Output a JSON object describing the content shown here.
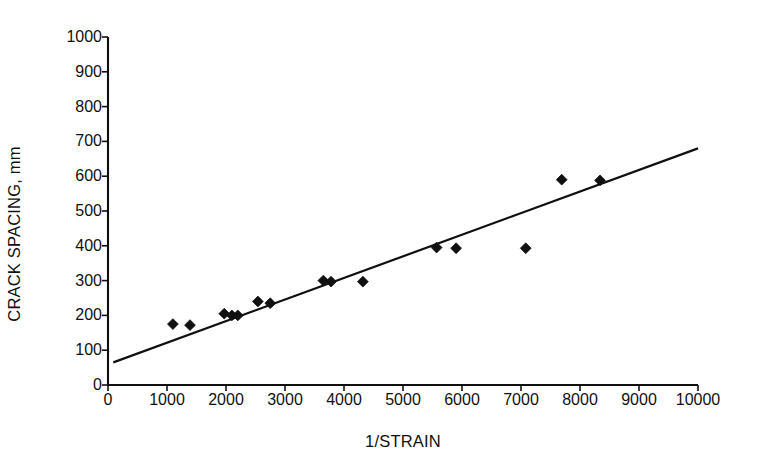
{
  "chart_data": {
    "type": "scatter",
    "title": "",
    "xlabel": "1/STRAIN",
    "ylabel": "CRACK SPACING, mm",
    "xlim": [
      0,
      10000
    ],
    "ylim": [
      0,
      1000
    ],
    "xticks": [
      0,
      1000,
      2000,
      3000,
      4000,
      5000,
      6000,
      7000,
      8000,
      9000,
      10000
    ],
    "yticks": [
      0,
      100,
      200,
      300,
      400,
      500,
      600,
      700,
      800,
      900,
      1000
    ],
    "xtick_labels": [
      "0",
      "1000",
      "2000",
      "3000",
      "4000",
      "5000",
      "6000",
      "7000",
      "8000",
      "9000",
      "10000"
    ],
    "ytick_labels": [
      "0",
      "100",
      "200",
      "300",
      "400",
      "500",
      "600",
      "700",
      "800",
      "900",
      "1000"
    ],
    "grid": false,
    "legend": null,
    "marker": "filled-diamond",
    "marker_color": "#101010",
    "line_color": "#101010",
    "axis_color": "#101010",
    "background": "#ffffff",
    "series": [
      {
        "name": "measured crack spacing",
        "type": "scatter",
        "points": [
          {
            "x": 1100,
            "y": 175
          },
          {
            "x": 1390,
            "y": 172
          },
          {
            "x": 1970,
            "y": 205
          },
          {
            "x": 2100,
            "y": 200
          },
          {
            "x": 2200,
            "y": 200
          },
          {
            "x": 2540,
            "y": 240
          },
          {
            "x": 2750,
            "y": 235
          },
          {
            "x": 3650,
            "y": 300
          },
          {
            "x": 3780,
            "y": 297
          },
          {
            "x": 4320,
            "y": 297
          },
          {
            "x": 5570,
            "y": 395
          },
          {
            "x": 5900,
            "y": 393
          },
          {
            "x": 7080,
            "y": 393
          },
          {
            "x": 7690,
            "y": 590
          },
          {
            "x": 8340,
            "y": 588
          }
        ]
      },
      {
        "name": "best-fit trend line",
        "type": "line",
        "points": [
          {
            "x": 90,
            "y": 65
          },
          {
            "x": 10000,
            "y": 680
          }
        ]
      }
    ]
  }
}
